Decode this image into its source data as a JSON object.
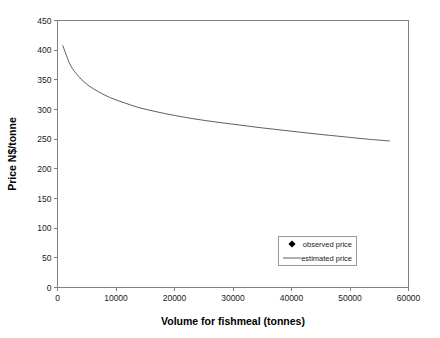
{
  "chart_data": {
    "type": "scatter",
    "title": "",
    "xlabel": "Volume for fishmeal (tonnes)",
    "ylabel": "Price N$/tonne",
    "xlim": [
      0,
      60000
    ],
    "ylim": [
      0,
      450
    ],
    "xticks": [
      0,
      10000,
      20000,
      30000,
      40000,
      50000,
      60000
    ],
    "xtick_labels": [
      "0",
      "10000",
      "20000",
      "30000",
      "40000",
      "50000",
      "60000"
    ],
    "yticks": [
      0,
      50,
      100,
      150,
      200,
      250,
      300,
      350,
      400,
      450
    ],
    "ytick_labels": [
      "0",
      "50",
      "100",
      "150",
      "200",
      "250",
      "300",
      "350",
      "400",
      "450"
    ],
    "grid": false,
    "legend_position": "lower-right",
    "series": [
      {
        "name": "observed price",
        "type": "scatter",
        "marker": "diamond",
        "color": "#000000",
        "points": [
          [
            1000,
            236
          ],
          [
            1500,
            398
          ],
          [
            2600,
            405
          ],
          [
            5100,
            255
          ],
          [
            10400,
            267
          ],
          [
            11000,
            333
          ],
          [
            15000,
            393
          ],
          [
            15200,
            307
          ],
          [
            15400,
            281
          ],
          [
            24800,
            243
          ],
          [
            27900,
            243
          ],
          [
            32800,
            145
          ],
          [
            32900,
            263
          ],
          [
            33300,
            296
          ],
          [
            36700,
            250
          ],
          [
            37200,
            295
          ],
          [
            39000,
            263
          ],
          [
            53500,
            264
          ]
        ]
      },
      {
        "name": "estimated price",
        "type": "line",
        "color": "#4d4d4d",
        "points": [
          [
            900,
            408
          ],
          [
            2200,
            375
          ],
          [
            3600,
            356
          ],
          [
            5200,
            341
          ],
          [
            7000,
            330
          ],
          [
            9000,
            320
          ],
          [
            11500,
            311
          ],
          [
            14000,
            303
          ],
          [
            17000,
            296
          ],
          [
            20000,
            290
          ],
          [
            23500,
            284
          ],
          [
            27000,
            279
          ],
          [
            31000,
            274
          ],
          [
            35000,
            269
          ],
          [
            39500,
            264
          ],
          [
            44000,
            259
          ],
          [
            49000,
            254
          ],
          [
            53000,
            250
          ],
          [
            56800,
            247
          ]
        ]
      }
    ],
    "legend_entries": [
      {
        "label": "observed price",
        "kind": "marker"
      },
      {
        "label": "estimated price",
        "kind": "line"
      }
    ]
  }
}
